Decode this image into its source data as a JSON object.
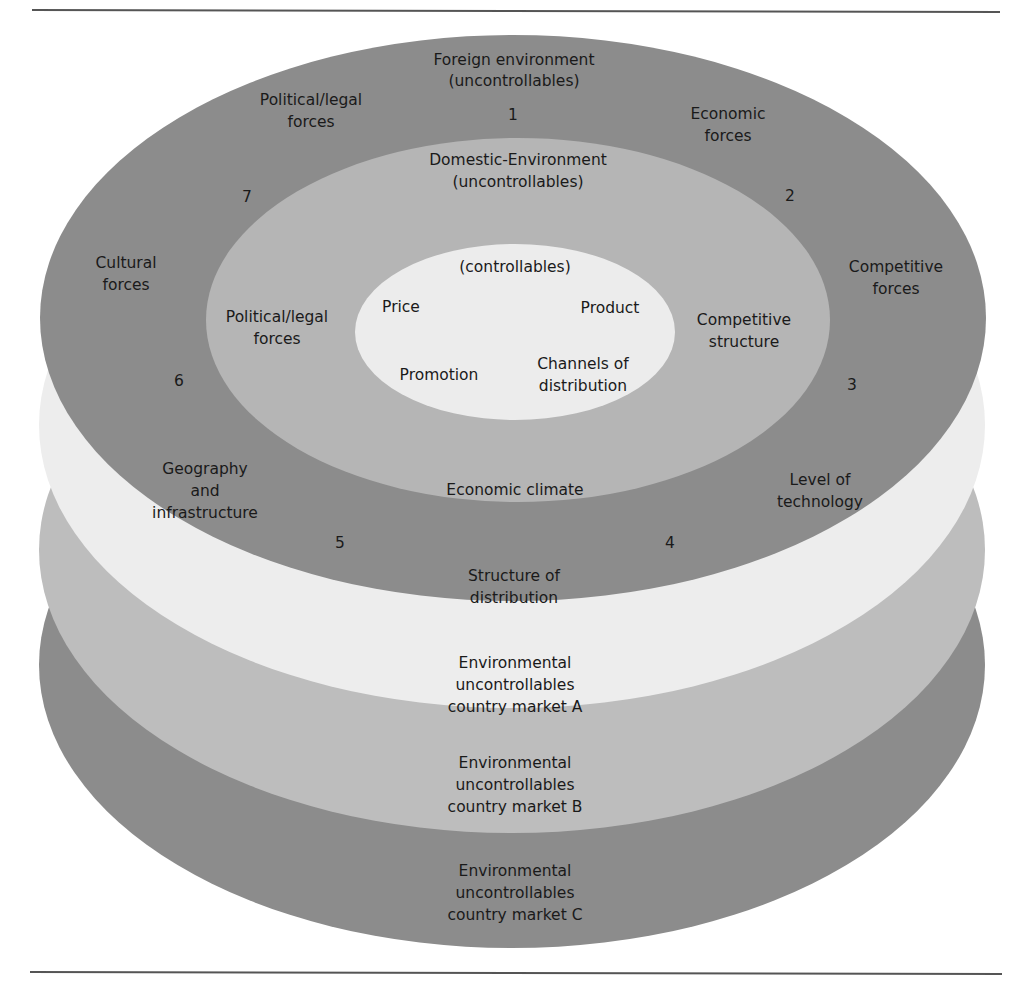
{
  "colors": {
    "dark_ring": "#8c8c8c",
    "mid_ring": "#b5b5b5",
    "inner_core": "#ececec",
    "layer_a": "#ededed",
    "layer_b": "#bdbdbd",
    "layer_c": "#8c8c8c",
    "rule": "#555555",
    "text": "#1a1a1a"
  },
  "foreign_environment": {
    "title_line1": "Foreign environment",
    "title_line2": "(uncontrollables)",
    "forces": [
      {
        "number": "1",
        "label_lines": [
          "Political/legal",
          "forces"
        ]
      },
      {
        "number": "2",
        "label_lines": [
          "Economic",
          "forces"
        ]
      },
      {
        "number": "3",
        "label_lines": [
          "Competitive",
          "forces"
        ]
      },
      {
        "number": "4",
        "label_lines": [
          "Level of",
          "technology"
        ]
      },
      {
        "number": "5",
        "label_lines": [
          "Structure of",
          "distribution"
        ]
      },
      {
        "number": "6",
        "label_lines": [
          "Geography",
          "and",
          "infrastructure"
        ]
      },
      {
        "number": "7",
        "label_lines": [
          "Cultural",
          "forces"
        ]
      }
    ]
  },
  "domestic_environment": {
    "title_line1": "Domestic-Environment",
    "title_line2": "(uncontrollables)",
    "forces": [
      {
        "label_lines": [
          "Political/legal",
          "forces"
        ]
      },
      {
        "label_lines": [
          "Competitive",
          "structure"
        ]
      },
      {
        "label_lines": [
          "Economic climate"
        ]
      }
    ]
  },
  "controllables": {
    "title": "(controllables)",
    "items": [
      {
        "label_lines": [
          "Price"
        ]
      },
      {
        "label_lines": [
          "Product"
        ]
      },
      {
        "label_lines": [
          "Promotion"
        ]
      },
      {
        "label_lines": [
          "Channels of",
          "distribution"
        ]
      }
    ]
  },
  "country_markets": [
    {
      "lines": [
        "Environmental",
        "uncontrollables",
        "country market A"
      ]
    },
    {
      "lines": [
        "Environmental",
        "uncontrollables",
        "country market B"
      ]
    },
    {
      "lines": [
        "Environmental",
        "uncontrollables",
        "country market C"
      ]
    }
  ]
}
